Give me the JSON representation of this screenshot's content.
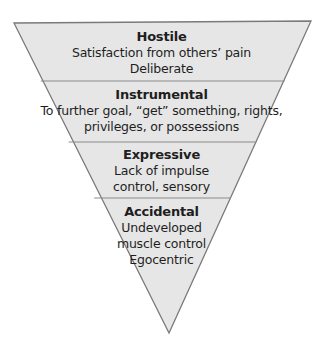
{
  "diagram": {
    "type": "inverted-pyramid",
    "fill_color": "#e6e6e6",
    "stroke_color": "#7a7a7a",
    "text_color": "#1e1e1e",
    "levels": [
      {
        "title": "Hostile",
        "lines": [
          "Satisfaction from others’ pain",
          "Deliberate"
        ]
      },
      {
        "title": "Instrumental",
        "lines": [
          "To further goal, “get” something, rights,",
          "privileges, or possessions"
        ]
      },
      {
        "title": "Expressive",
        "lines": [
          "Lack of impulse",
          "control, sensory"
        ]
      },
      {
        "title": "Accidental",
        "lines": [
          "Undeveloped",
          "muscle control",
          "Egocentric"
        ]
      }
    ]
  }
}
